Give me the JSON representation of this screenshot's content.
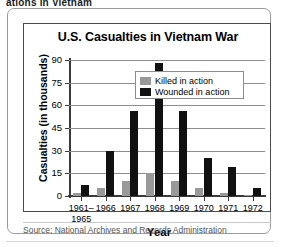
{
  "page": {
    "top_cutoff_text": "ations in Vietnam"
  },
  "chart_card": {
    "title": "U.S. Casualties in Vietnam War",
    "source_label": "Source: National Archives and Records Administration"
  },
  "legend": {
    "position": "inside-top-right",
    "entries": [
      {
        "label": "Killed in action",
        "color": "#999999"
      },
      {
        "label": "Wounded in action",
        "color": "#111111"
      }
    ]
  },
  "axes": {
    "y_title": "Casualties (in thousands)",
    "x_title": "Year",
    "y_ticks": [
      "0",
      "15",
      "30",
      "45",
      "60",
      "75",
      "90"
    ]
  },
  "chart_data": {
    "type": "bar",
    "title": "U.S. Casualties in Vietnam War",
    "xlabel": "Year",
    "ylabel": "Casualties (in thousands)",
    "ylim": [
      0,
      90
    ],
    "ytick_values": [
      0,
      15,
      30,
      45,
      60,
      75,
      90
    ],
    "grid": true,
    "legend_position": "inside-top-right",
    "categories": [
      "1961–\n1965",
      "1966",
      "1967",
      "1968",
      "1969",
      "1970",
      "1971",
      "1972"
    ],
    "category_labels": [
      {
        "line1": "1961–",
        "line2": "1965"
      },
      {
        "line1": "1966",
        "line2": ""
      },
      {
        "line1": "1967",
        "line2": ""
      },
      {
        "line1": "1968",
        "line2": ""
      },
      {
        "line1": "1969",
        "line2": ""
      },
      {
        "line1": "1970",
        "line2": ""
      },
      {
        "line1": "1971",
        "line2": ""
      },
      {
        "line1": "1972",
        "line2": ""
      }
    ],
    "series": [
      {
        "name": "Killed in action",
        "color": "#999999",
        "values": [
          2,
          5,
          10,
          15.5,
          10,
          5,
          2,
          0.3
        ]
      },
      {
        "name": "Wounded in action",
        "color": "#111111",
        "values": [
          7.5,
          30,
          56,
          88,
          56,
          25,
          19,
          5
        ]
      }
    ]
  }
}
